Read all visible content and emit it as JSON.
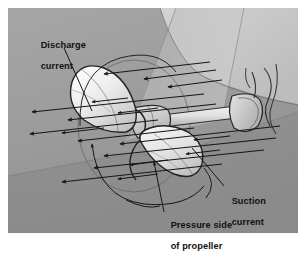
{
  "figure": {
    "name": "propeller-flow-diagram",
    "background_color": "#9a9a9a",
    "page_color": "#ffffff",
    "border_color": "#8d8d8d",
    "ink_color": "#1a1a1a"
  },
  "labels": {
    "discharge": {
      "line1": "Discharge",
      "line2": "current",
      "full": "Discharge current"
    },
    "suction": {
      "line1": "Suction",
      "line2": "current",
      "full": "Suction current"
    },
    "pressure": {
      "line1": "Pressure side",
      "line2": "of propeller",
      "full": "Pressure side of propeller"
    }
  },
  "annotations": {
    "discharge_leader": "leader-line-from-discharge-label-to-flow-streamlines",
    "suction_leader": "leader-line-from-suction-label-to-aft-streamlines",
    "pressure_leader": "leader-line-from-pressure-label-to-lower-blade",
    "rotation_arc": "curved-arrow-indicating-propeller-rotation"
  },
  "flow": {
    "discharge_arrow_direction": "left",
    "suction_arrow_direction": "left",
    "streamline_count": 11,
    "arrowhead_count": 22
  },
  "parts": {
    "upper_blade": "propeller-blade-upper",
    "lower_blade": "propeller-blade-lower",
    "hub": "propeller-hub",
    "shaft": "propeller-shaft",
    "strut": "shaft-strut-bracket",
    "hull": "hull-underside"
  }
}
